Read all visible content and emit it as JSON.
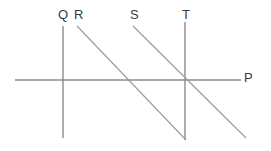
{
  "figure": {
    "kind": "line-diagram",
    "width": 271,
    "height": 151,
    "background": "#ffffff",
    "stroke_color": "#8c8c8c",
    "label_color": "#3a3a3a"
  },
  "labels": {
    "Q": "Q",
    "R": "R",
    "S": "S",
    "T": "T",
    "P": "P"
  },
  "chart_data": {
    "type": "line",
    "title": "",
    "xlabel": "P",
    "ylabel": "",
    "grid": false,
    "legend": "none",
    "series": [
      {
        "name": "P",
        "role": "horizontal-axis",
        "orientation": "horizontal",
        "points": [
          [
            15,
            80
          ],
          [
            241,
            80
          ]
        ],
        "label": "P",
        "label_position": [
          244,
          71
        ]
      },
      {
        "name": "Q",
        "role": "vertical-line",
        "orientation": "vertical",
        "points": [
          [
            63,
            26
          ],
          [
            63,
            138
          ]
        ],
        "label": "Q",
        "label_position": [
          58,
          8
        ]
      },
      {
        "name": "R",
        "role": "downward-sloping-line",
        "orientation": "diagonal",
        "points": [
          [
            77,
            26
          ],
          [
            186,
            140
          ]
        ],
        "label": "R",
        "label_position": [
          74,
          8
        ]
      },
      {
        "name": "S",
        "role": "downward-sloping-line",
        "orientation": "diagonal",
        "points": [
          [
            133,
            26
          ],
          [
            246,
            138
          ]
        ],
        "label": "S",
        "label_position": [
          130,
          8
        ]
      },
      {
        "name": "T",
        "role": "vertical-line",
        "orientation": "vertical",
        "points": [
          [
            185,
            22
          ],
          [
            185,
            140
          ]
        ],
        "label": "T",
        "label_position": [
          182,
          8
        ]
      }
    ],
    "intersections": [
      {
        "name": "Q-P",
        "lines": [
          "Q",
          "P"
        ],
        "point": [
          63,
          80
        ]
      },
      {
        "name": "R-P",
        "lines": [
          "R",
          "P"
        ],
        "point": [
          130,
          80
        ]
      },
      {
        "name": "S-T-P",
        "lines": [
          "S",
          "T",
          "P"
        ],
        "point": [
          185,
          80
        ]
      },
      {
        "name": "R-T",
        "lines": [
          "R",
          "T"
        ],
        "point": [
          185,
          139
        ]
      }
    ]
  }
}
